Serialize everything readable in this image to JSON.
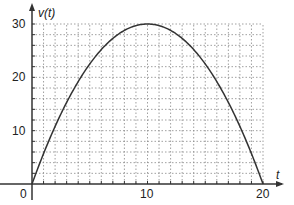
{
  "chart_data": {
    "type": "line",
    "title": "",
    "xlabel": "t",
    "ylabel": "v(t)",
    "xlim": [
      0,
      20
    ],
    "ylim": [
      0,
      30
    ],
    "grid": true,
    "grid_style": "dotted",
    "grid_step_x": 1,
    "grid_step_y": 2,
    "x_ticks": [
      0,
      10,
      20
    ],
    "y_ticks": [
      10,
      20,
      30
    ],
    "x_tick_labels": [
      "0",
      "10",
      "20"
    ],
    "y_tick_labels": [
      "10",
      "20",
      "30"
    ],
    "legend": null,
    "series": [
      {
        "name": "v(t)",
        "formula": "v(t) = 6t - 0.3t^2",
        "x": [
          0,
          2,
          4,
          6,
          8,
          10,
          12,
          14,
          16,
          18,
          20
        ],
        "values": [
          0,
          10.8,
          19.2,
          25.2,
          28.8,
          30,
          28.8,
          25.2,
          19.2,
          10.8,
          0
        ]
      }
    ],
    "annotations": [
      {
        "text": "maximum",
        "x": 10,
        "y": 30
      }
    ]
  },
  "labels": {
    "y_axis": "v(t)",
    "x_axis": "t",
    "origin": "0",
    "x10": "10",
    "x20": "20",
    "y10": "10",
    "y20": "20",
    "y30": "30"
  },
  "colors": {
    "curve": "#333333",
    "axis": "#333333",
    "grid": "#888888"
  }
}
